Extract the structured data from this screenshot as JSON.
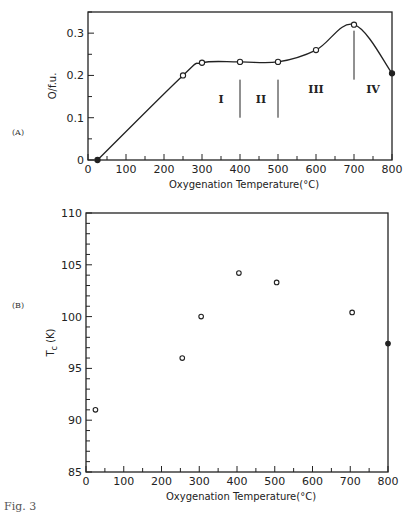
{
  "chart_data": [
    {
      "panel": "(A)",
      "type": "line",
      "title": "",
      "xlabel": "Oxygenation Temperature (°C)",
      "ylabel": "O/f.u.",
      "xlim": [
        0,
        800
      ],
      "ylim": [
        0,
        0.35
      ],
      "xticks": [
        0,
        100,
        200,
        300,
        400,
        500,
        600,
        700,
        800
      ],
      "yticks": [
        0,
        0.1,
        0.2,
        0.3
      ],
      "grid": false,
      "series": [
        {
          "name": "O/f.u.",
          "x": [
            25,
            250,
            300,
            400,
            500,
            600,
            700,
            800
          ],
          "y": [
            0,
            0.2,
            0.23,
            0.232,
            0.232,
            0.26,
            0.32,
            0.205
          ],
          "markers": [
            "filled",
            "open",
            "open",
            "open",
            "open",
            "open",
            "open",
            "filled"
          ]
        }
      ],
      "annotations": {
        "region_dividers_x": [
          400,
          500,
          700
        ],
        "regions": [
          {
            "label": "I",
            "x": 350
          },
          {
            "label": "II",
            "x": 455
          },
          {
            "label": "III",
            "x": 600
          },
          {
            "label": "IV",
            "x": 750
          }
        ]
      }
    },
    {
      "panel": "(B)",
      "type": "scatter",
      "title": "",
      "xlabel": "Oxygenation Temperature (°C)",
      "ylabel": "Tc (K)",
      "xlim": [
        0,
        800
      ],
      "ylim": [
        85,
        110
      ],
      "xticks": [
        0,
        100,
        200,
        300,
        400,
        500,
        600,
        700,
        800
      ],
      "yticks": [
        85,
        90,
        95,
        100,
        105,
        110
      ],
      "grid": false,
      "series": [
        {
          "name": "Tc",
          "x": [
            25,
            255,
            305,
            405,
            505,
            705,
            800
          ],
          "y": [
            91,
            96,
            100,
            104.2,
            103.3,
            100.4,
            97.4
          ],
          "markers": [
            "open",
            "open",
            "open",
            "open",
            "open",
            "open",
            "filled"
          ]
        }
      ]
    }
  ],
  "labels": {
    "panel_a": "(A)",
    "panel_b": "(B)",
    "xlabel": "Oxygenation Temperature (°C)",
    "ylabel_a": "O/f.u.",
    "ylabel_b_main": "T",
    "ylabel_b_sub": "c",
    "ylabel_b_unit": " (K)",
    "caption": "Fig. 3"
  }
}
